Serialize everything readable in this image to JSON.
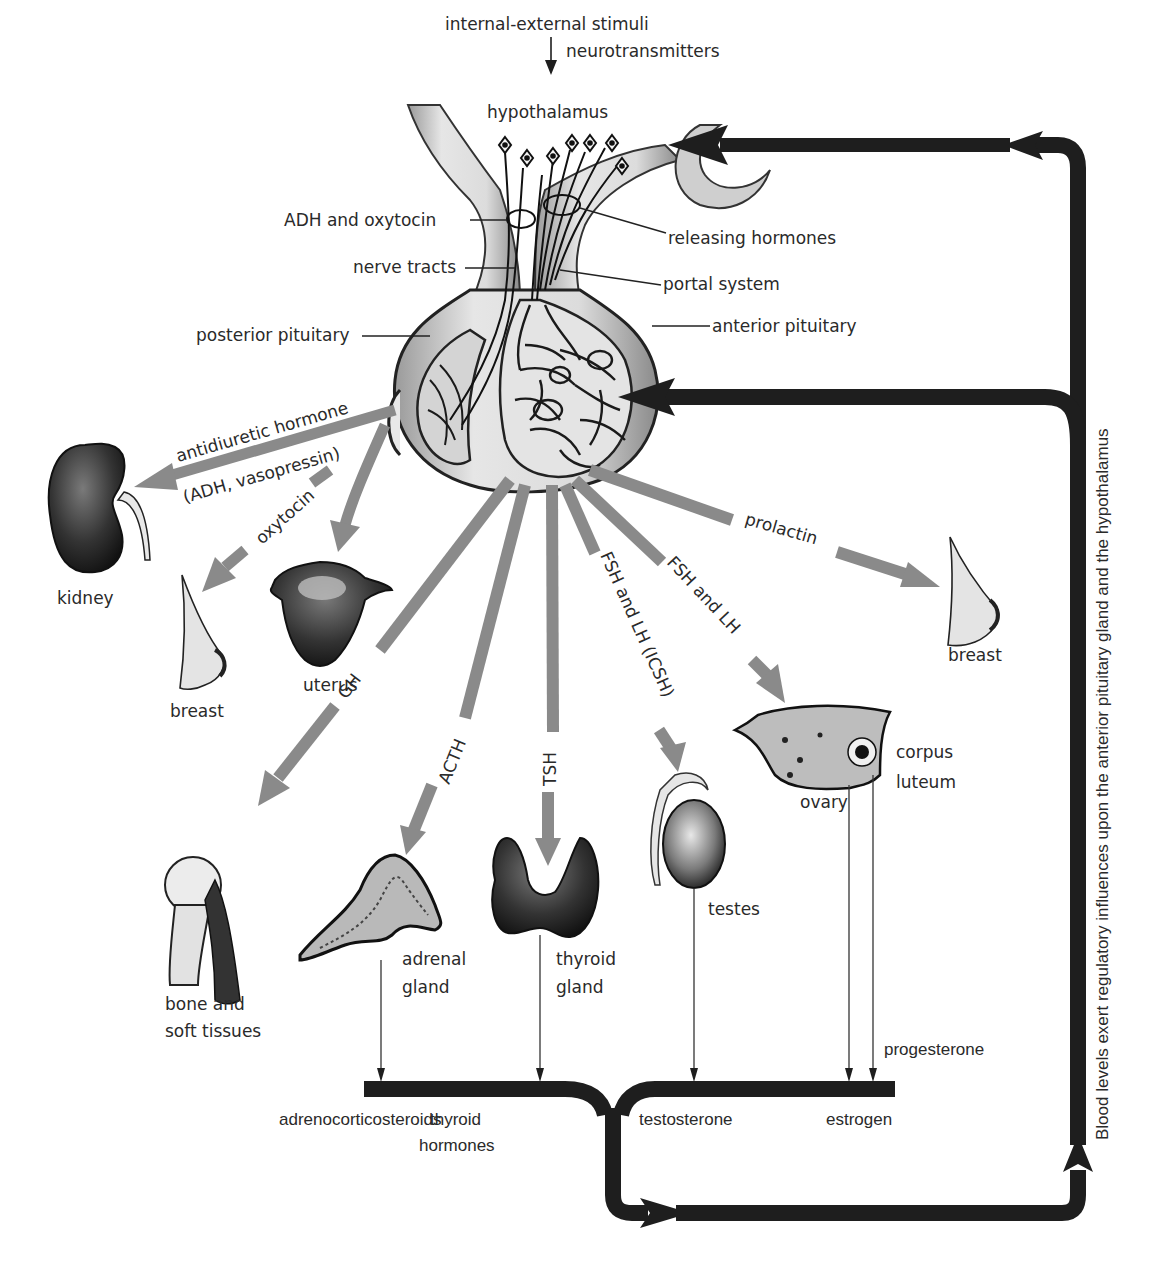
{
  "header": {
    "stimuli": "internal-external stimuli",
    "neurotransmitters": "neurotransmitters",
    "hypothalamus": "hypothalamus"
  },
  "pituitary_labels": {
    "adh_oxytocin": "ADH and oxytocin",
    "releasing_hormones": "releasing hormones",
    "nerve_tracts": "nerve tracts",
    "portal_system": "portal system",
    "posterior_pituitary": "posterior pituitary",
    "anterior_pituitary": "anterior pituitary"
  },
  "hormones": {
    "antidiuretic_line1": "antidiuretic hormone",
    "antidiuretic_line2": "(ADH, vasopressin)",
    "oxytocin": "oxytocin",
    "prolactin": "prolactin",
    "gh": "GH",
    "acth": "ACTH",
    "tsh": "TSH",
    "fsh_lh_icsh": "FSH and LH (ICSH)",
    "fsh_lh": "FSH and LH"
  },
  "targets": {
    "kidney": "kidney",
    "breast_left": "breast",
    "uterus": "uterus",
    "breast_right": "breast",
    "bone_line1": "bone and",
    "bone_line2": "soft tissues",
    "adrenal_line1": "adrenal",
    "adrenal_line2": "gland",
    "thyroid_line1": "thyroid",
    "thyroid_line2": "gland",
    "testes": "testes",
    "ovary": "ovary",
    "corpus_line1": "corpus",
    "corpus_line2": "luteum"
  },
  "secretions": {
    "adrenocorticosteroids": "adrenocorticosteroids",
    "thyroid_line1": "thyroid",
    "thyroid_line2": "hormones",
    "testosterone": "testosterone",
    "estrogen": "estrogen",
    "progesterone": "progesterone"
  },
  "feedback": {
    "caption": "Blood levels exert regulatory influences upon the anterior pituitary gland and the hypothalamus"
  },
  "colors": {
    "hormone_arrow": "#8a8a8a",
    "feedback_arrow": "#1e1e1e",
    "text": "#2a2a2a"
  }
}
